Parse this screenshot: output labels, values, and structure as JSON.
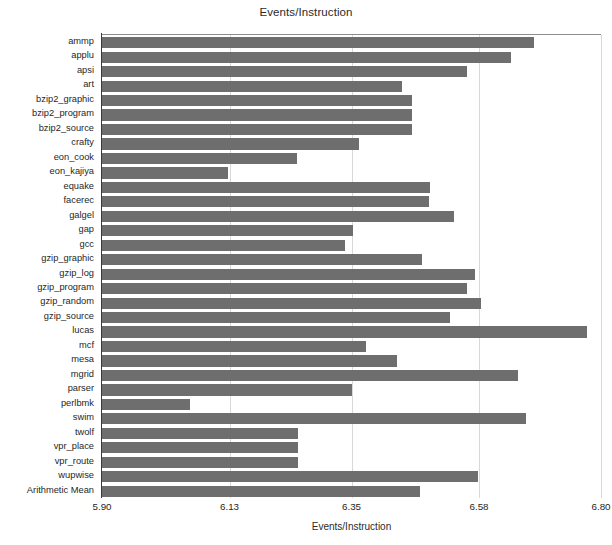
{
  "chart_data": {
    "type": "bar",
    "orientation": "horizontal",
    "title": "Events/Instruction",
    "xlabel": "Events/Instruction",
    "ylabel": "",
    "xlim": [
      5.9,
      6.8
    ],
    "xticks": [
      "5.90",
      "6.13",
      "6.35",
      "6.58",
      "6.80"
    ],
    "xtick_values": [
      5.9,
      6.13,
      6.35,
      6.58,
      6.8
    ],
    "grid": true,
    "legend": null,
    "bar_color": "#6e6e6e",
    "categories": [
      "ammp",
      "applu",
      "apsi",
      "art",
      "bzip2_graphic",
      "bzip2_program",
      "bzip2_source",
      "crafty",
      "eon_cook",
      "eon_kajiya",
      "equake",
      "facerec",
      "galgel",
      "gap",
      "gcc",
      "gzip_graphic",
      "gzip_log",
      "gzip_program",
      "gzip_random",
      "gzip_source",
      "lucas",
      "mcf",
      "mesa",
      "mgrid",
      "parser",
      "perlbmk",
      "swim",
      "twolf",
      "vpr_place",
      "vpr_route",
      "wupwise",
      "Arithmetic Mean"
    ],
    "values": [
      6.679,
      6.638,
      6.558,
      6.441,
      6.46,
      6.46,
      6.46,
      6.364,
      6.252,
      6.128,
      6.492,
      6.489,
      6.535,
      6.353,
      6.339,
      6.478,
      6.572,
      6.559,
      6.583,
      6.527,
      6.775,
      6.376,
      6.432,
      6.651,
      6.35,
      6.058,
      6.664,
      6.253,
      6.253,
      6.253,
      6.579,
      6.474
    ]
  },
  "title": "Events/Instruction"
}
